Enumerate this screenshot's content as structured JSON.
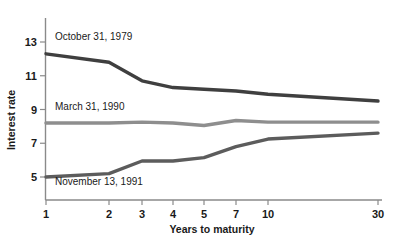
{
  "chart_data": {
    "type": "line",
    "title": "",
    "xlabel": "Years to maturity",
    "ylabel": "Interest rate",
    "x_tick_labels": [
      "1",
      "2",
      "3",
      "4",
      "5",
      "7",
      "10",
      "30"
    ],
    "x": [
      1,
      2,
      3,
      4,
      5,
      7,
      10,
      30
    ],
    "y_tick_labels": [
      "13",
      "11",
      "9",
      "7",
      "5"
    ],
    "y_ticks": [
      13,
      11,
      9,
      7,
      5
    ],
    "ylim": [
      4.2,
      13.6
    ],
    "grid": false,
    "legend": "inline-labels",
    "series": [
      {
        "name": "October 31, 1979",
        "color": "#3f3f3f",
        "label_x": 2,
        "label_y": 13.1,
        "values": [
          12.3,
          11.8,
          10.7,
          10.3,
          10.2,
          10.1,
          9.9,
          9.5
        ]
      },
      {
        "name": "March 31, 1990",
        "color": "#8e8e8e",
        "label_x": 2,
        "label_y": 8.95,
        "values": [
          8.2,
          8.2,
          8.25,
          8.2,
          8.05,
          8.35,
          8.25,
          8.25
        ]
      },
      {
        "name": "November 13, 1991",
        "color": "#5c5c5c",
        "label_x": 2,
        "label_y": 4.55,
        "values": [
          5.0,
          5.2,
          5.95,
          5.95,
          6.15,
          6.8,
          7.25,
          7.6
        ]
      }
    ]
  }
}
